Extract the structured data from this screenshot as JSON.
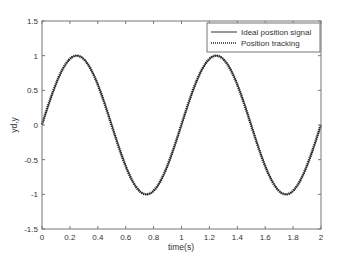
{
  "chart_data": {
    "type": "line",
    "title": "",
    "xlabel": "time(s)",
    "ylabel": "yd,y",
    "xlim": [
      0,
      2
    ],
    "ylim": [
      -1.5,
      1.5
    ],
    "xticks": [
      "0",
      "0.2",
      "0.4",
      "0.6",
      "0.8",
      "1",
      "1.2",
      "1.4",
      "1.6",
      "1.8",
      "2"
    ],
    "yticks": [
      "-1.5",
      "-1",
      "-0.5",
      "0",
      "0.5",
      "1",
      "1.5"
    ],
    "grid": false,
    "legend_position": "upper right",
    "series": [
      {
        "name": "Ideal position signal",
        "style": "solid",
        "function": "sin(2*pi*t)",
        "x": [
          0,
          0.125,
          0.25,
          0.375,
          0.5,
          0.625,
          0.75,
          0.875,
          1,
          1.125,
          1.25,
          1.375,
          1.5,
          1.625,
          1.75,
          1.875,
          2
        ],
        "values": [
          0,
          0.71,
          1,
          0.71,
          0,
          -0.71,
          -1,
          -0.71,
          0,
          0.71,
          1,
          0.71,
          0,
          -0.71,
          -1,
          -0.71,
          0
        ]
      },
      {
        "name": "Position tracking",
        "style": "dotted",
        "x": [
          0,
          0.125,
          0.25,
          0.375,
          0.5,
          0.625,
          0.75,
          0.875,
          1,
          1.125,
          1.25,
          1.375,
          1.5,
          1.625,
          1.75,
          1.875,
          2
        ],
        "values": [
          0.02,
          0.71,
          1,
          0.71,
          0,
          -0.71,
          -1,
          -0.71,
          0,
          0.71,
          1,
          0.71,
          0,
          -0.71,
          -1,
          -0.71,
          -0.03
        ]
      }
    ]
  }
}
